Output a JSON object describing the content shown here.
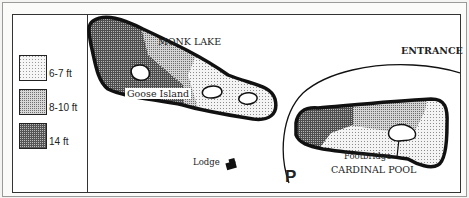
{
  "legend": {
    "items": [
      {
        "label": "6-7 ft",
        "depth": "shallow",
        "color": "#e2e2e2"
      },
      {
        "label": "8-10 ft",
        "depth": "medium",
        "color": "#a8a8a8"
      },
      {
        "label": "14 ft",
        "depth": "deep",
        "color": "#4a4a4a"
      }
    ]
  },
  "map": {
    "lakes": [
      {
        "name": "MONK LAKE"
      },
      {
        "name": "CARDINAL POOL"
      }
    ],
    "labels": {
      "monk_lake": "MONK LAKE",
      "goose_island": "Goose Island",
      "entrance": "ENTRANCE",
      "lodge": "Lodge",
      "parking": "P",
      "footbridge": "Footbridge",
      "cardinal_pool": "CARDINAL POOL"
    },
    "icons": {
      "lodge": "building-icon",
      "parking": "parking-icon"
    }
  }
}
